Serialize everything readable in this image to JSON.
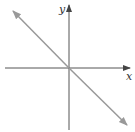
{
  "diagram": {
    "type": "coordinate-plane-line",
    "x_axis_label": "x",
    "y_axis_label": "y",
    "line": {
      "equation": "y = -x",
      "slope": -1,
      "intercept": 0,
      "color": "#999999"
    },
    "axis_color": "#555555"
  }
}
